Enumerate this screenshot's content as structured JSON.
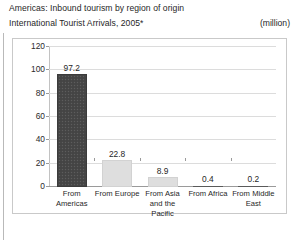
{
  "header": {
    "title_line1": "Americas: Inbound tourism by region of origin",
    "title_line2": "International Tourist Arrivals, 2005*",
    "unit": "(million)"
  },
  "chart_data": {
    "type": "bar",
    "title": "Americas: Inbound tourism by region of origin",
    "subtitle": "International Tourist Arrivals, 2005*",
    "xlabel": "",
    "ylabel": "",
    "unit": "(million)",
    "categories": [
      "From Americas",
      "From Europe",
      "From Asia and the Pacific",
      "From Africa",
      "From Middle East"
    ],
    "values": [
      97.2,
      22.8,
      8.9,
      0.4,
      0.2
    ],
    "value_labels": [
      "97.2",
      "22.8",
      "8.9",
      "0.4",
      "0.2"
    ],
    "bar_colors": [
      "#474747",
      "#dedede",
      "#dedede",
      "#5a5a5a",
      "#5a5a5a"
    ],
    "ylim": [
      0,
      120
    ],
    "yticks": [
      0,
      20,
      40,
      60,
      80,
      100,
      120
    ],
    "ytick_labels": [
      "0",
      "20",
      "40",
      "60",
      "80",
      "100",
      "120"
    ],
    "grid": true,
    "legend": false
  }
}
